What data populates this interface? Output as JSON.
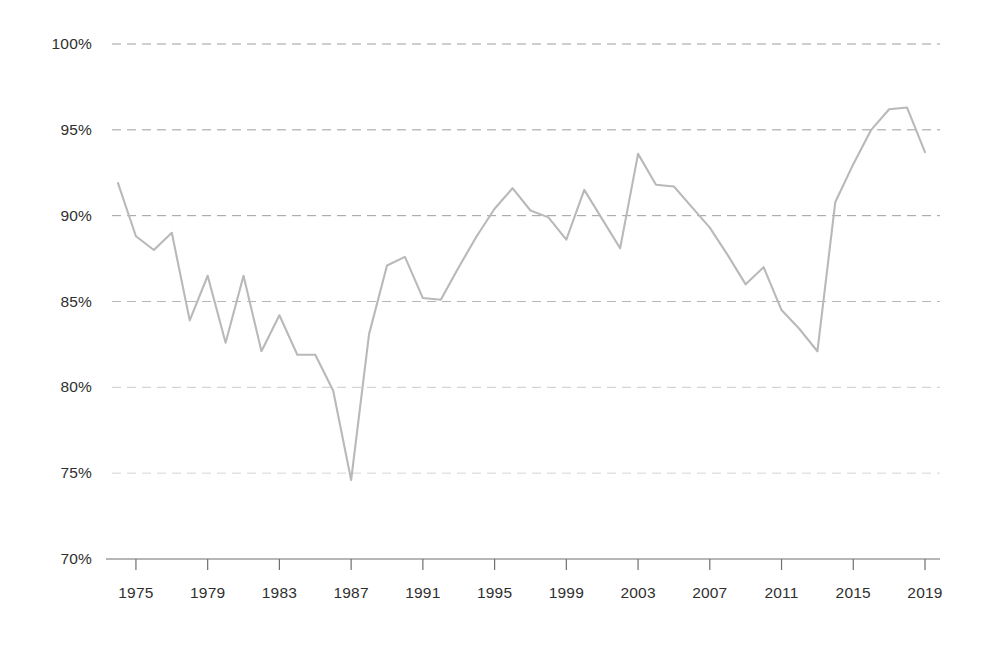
{
  "chart_data": {
    "type": "line",
    "title": "",
    "subtitle": "",
    "xlabel": "",
    "ylabel": "",
    "xlim": [
      1974,
      2019
    ],
    "ylim": [
      70,
      100
    ],
    "grid": true,
    "legend": null,
    "legend_position": "none",
    "y_tick_labels": [
      "100%",
      "95%",
      "90%",
      "85%",
      "80%",
      "75%",
      "70%"
    ],
    "y_tick_values": [
      100,
      95,
      90,
      85,
      80,
      75,
      70
    ],
    "x_tick_labels": [
      "1975",
      "1979",
      "1983",
      "1987",
      "1991",
      "1995",
      "1999",
      "2003",
      "2007",
      "2011",
      "2015",
      "2019"
    ],
    "x_tick_values": [
      1975,
      1979,
      1983,
      1987,
      1991,
      1995,
      1999,
      2003,
      2007,
      2011,
      2015,
      2019
    ],
    "series": [
      {
        "name": "",
        "x": [
          1974,
          1975,
          1976,
          1977,
          1978,
          1979,
          1980,
          1981,
          1982,
          1983,
          1984,
          1985,
          1986,
          1987,
          1988,
          1989,
          1990,
          1991,
          1992,
          1993,
          1994,
          1995,
          1996,
          1997,
          1998,
          1999,
          2000,
          2001,
          2002,
          2003,
          2004,
          2005,
          2006,
          2007,
          2008,
          2009,
          2010,
          2011,
          2012,
          2013,
          2014,
          2015,
          2016,
          2017,
          2018,
          2019
        ],
        "values": [
          91.9,
          88.8,
          88.0,
          89.0,
          83.9,
          86.5,
          82.6,
          86.5,
          82.1,
          84.2,
          81.9,
          81.9,
          79.8,
          74.6,
          83.1,
          87.1,
          87.6,
          85.2,
          85.1,
          87.0,
          88.8,
          90.4,
          91.6,
          90.3,
          89.9,
          88.6,
          91.5,
          89.8,
          88.1,
          93.6,
          91.8,
          91.7,
          90.5,
          89.3,
          87.7,
          86.0,
          87.0,
          84.5,
          83.4,
          82.1,
          90.8,
          93.0,
          95.0,
          96.2,
          96.3,
          93.7
        ]
      }
    ],
    "colors": {
      "line": "#b9b9b9",
      "gridline": "#9a9a9a",
      "axis": "#6f6f6f",
      "text": "#2f2f2f",
      "background": "#ffffff"
    }
  }
}
